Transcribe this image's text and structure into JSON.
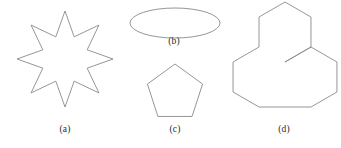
{
  "figure": {
    "width": 341,
    "height": 148,
    "background_color": "#ffffff",
    "stroke_color": "#8a8a8a",
    "label_color": "#2b2b2b",
    "panels": [
      {
        "key": "a",
        "label": "(a)",
        "shape_name": "eight-pointed-star",
        "description": "Eight-pointed star outline",
        "center": [
          65,
          59
        ],
        "outer_radius": 48,
        "inner_radius": 24,
        "points": 8,
        "rotation_deg": -90
      },
      {
        "key": "b",
        "label": "(b)",
        "shape_name": "ellipse",
        "description": "Wide horizontal ellipse outline",
        "center": [
          175,
          23
        ],
        "radius_x": 45,
        "radius_y": 15
      },
      {
        "key": "c",
        "label": "(c)",
        "shape_name": "regular-pentagon",
        "description": "Regular pentagon outline, flat bottom",
        "center": [
          175,
          93
        ],
        "circumradius": 29,
        "sides": 5,
        "rotation_deg": -90
      },
      {
        "key": "d",
        "label": "(d)",
        "shape_name": "tri-hexagon-cluster",
        "description": "Outline of three hexagons joined in a triangular arrangement",
        "center": [
          285,
          59
        ],
        "hex_radius": 30
      }
    ]
  }
}
